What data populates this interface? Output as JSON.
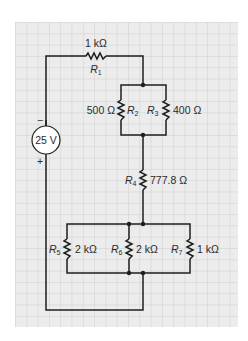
{
  "grid": {
    "background": "#ececec",
    "line_color": "#c6c6c6",
    "cell_px": 11.3
  },
  "wire_color": "#1e1e1e",
  "source": {
    "label": "25 V",
    "minus": "−",
    "plus": "+"
  },
  "resistors": [
    {
      "name": "R",
      "sub": "1",
      "value": "1 kΩ"
    },
    {
      "name": "R",
      "sub": "2",
      "value": "500 Ω"
    },
    {
      "name": "R",
      "sub": "3",
      "value": "400 Ω"
    },
    {
      "name": "R",
      "sub": "4",
      "value": "777.8 Ω"
    },
    {
      "name": "R",
      "sub": "5",
      "value": "2 kΩ"
    },
    {
      "name": "R",
      "sub": "6",
      "value": "2 kΩ"
    },
    {
      "name": "R",
      "sub": "7",
      "value": "1 kΩ"
    }
  ]
}
